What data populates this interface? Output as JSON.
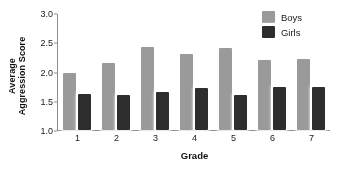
{
  "chart_data": {
    "type": "bar",
    "title": "",
    "subtitle": "",
    "xlabel": "Grade",
    "ylabel": "Average Aggression Score",
    "ylabel_line1": "Average",
    "ylabel_line2": "Aggression Score",
    "categories": [
      "1",
      "2",
      "3",
      "4",
      "5",
      "6",
      "7"
    ],
    "series": [
      {
        "name": "Boys",
        "color": "#9a9a9a",
        "values": [
          1.97,
          2.15,
          2.42,
          2.3,
          2.4,
          2.2,
          2.22
        ]
      },
      {
        "name": "Girls",
        "color": "#2e2e2e",
        "values": [
          1.62,
          1.6,
          1.65,
          1.72,
          1.6,
          1.73,
          1.73
        ]
      }
    ],
    "ylim": [
      1.0,
      3.0
    ],
    "yticks": [
      "3.0",
      "2.5",
      "2.0",
      "1.5",
      "1.0"
    ],
    "ytick_values": [
      3.0,
      2.5,
      2.0,
      1.5,
      1.0
    ],
    "grid": false,
    "legend_position": "top-right"
  },
  "legend": {
    "items": [
      {
        "label": "Boys",
        "color": "#9a9a9a"
      },
      {
        "label": "Girls",
        "color": "#2e2e2e"
      }
    ]
  }
}
